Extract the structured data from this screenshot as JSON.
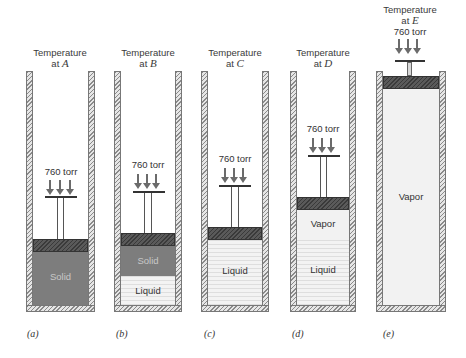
{
  "figure": {
    "pressure_label": "760 torr",
    "panels": [
      {
        "id": "a",
        "caption": "(a)",
        "title_line1": "Temperature",
        "title_line2_prefix": "at ",
        "temperature_point": "A",
        "phases": [
          {
            "name": "Solid",
            "type": "solid"
          }
        ]
      },
      {
        "id": "b",
        "caption": "(b)",
        "title_line1": "Temperature",
        "title_line2_prefix": "at ",
        "temperature_point": "B",
        "phases": [
          {
            "name": "Solid",
            "type": "solid"
          },
          {
            "name": "Liquid",
            "type": "liquid"
          }
        ]
      },
      {
        "id": "c",
        "caption": "(c)",
        "title_line1": "Temperature",
        "title_line2_prefix": "at ",
        "temperature_point": "C",
        "phases": [
          {
            "name": "Liquid",
            "type": "liquid"
          }
        ]
      },
      {
        "id": "d",
        "caption": "(d)",
        "title_line1": "Temperature",
        "title_line2_prefix": "at ",
        "temperature_point": "D",
        "phases": [
          {
            "name": "Vapor",
            "type": "vapor"
          },
          {
            "name": "Liquid",
            "type": "liquid"
          }
        ]
      },
      {
        "id": "e",
        "caption": "(e)",
        "title_line1": "Temperature",
        "title_line2_prefix": "at ",
        "temperature_point": "E",
        "phases": [
          {
            "name": "Vapor",
            "type": "vapor"
          }
        ]
      }
    ]
  },
  "colors": {
    "solid": "#7d7d7d",
    "liquid": "#f3f3f3",
    "vapor": "#f2f2f2",
    "piston": "#5a5a5a",
    "arrow": "#6b6b6b"
  }
}
